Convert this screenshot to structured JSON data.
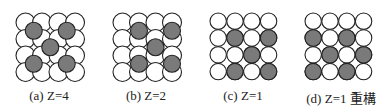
{
  "figure": {
    "colors": {
      "white_atom": "#ffffff",
      "gray_atom": "#7a7a7a",
      "stroke": "#222222"
    },
    "panels": [
      {
        "id": "a",
        "caption": "(a) Z=4",
        "layout": "overlapping",
        "grid_origin": [
          16,
          13
        ],
        "spacing": 16.5,
        "white_radius": 9.5,
        "gray_radius": 8.5,
        "gray_positions": [
          [
            0.5,
            0.5
          ],
          [
            0.5,
            2.5
          ],
          [
            1.5,
            1.5
          ],
          [
            2.5,
            0.5
          ],
          [
            2.5,
            2.5
          ]
        ]
      },
      {
        "id": "b",
        "caption": "(b) Z=2",
        "layout": "overlapping",
        "grid_origin": [
          113,
          13
        ],
        "spacing": 16.5,
        "white_radius": 9.5,
        "gray_radius": 8.5,
        "gray_positions": [
          [
            0.5,
            1
          ],
          [
            0.5,
            3
          ],
          [
            1.5,
            2
          ],
          [
            2.5,
            1
          ],
          [
            2.5,
            3
          ]
        ]
      },
      {
        "id": "c",
        "caption": "(c) Z=1",
        "layout": "square",
        "grid_origin": [
          210,
          13
        ],
        "spacing": 16.8,
        "white_radius": 8.2,
        "gray_radius": 8.2,
        "gray_positions": [
          [
            1,
            1
          ],
          [
            1,
            3
          ],
          [
            2,
            2
          ],
          [
            3,
            1
          ],
          [
            3,
            3
          ]
        ]
      },
      {
        "id": "d",
        "caption": "(d) Z=1 重構",
        "layout": "square",
        "grid_origin": [
          305,
          13
        ],
        "spacing": 16.8,
        "white_radius": 8.2,
        "gray_radius": 8.2,
        "gray_positions": [
          [
            1,
            0
          ],
          [
            1,
            2
          ],
          [
            2,
            1
          ],
          [
            2,
            3
          ],
          [
            3,
            0
          ],
          [
            3,
            2
          ]
        ]
      }
    ]
  }
}
